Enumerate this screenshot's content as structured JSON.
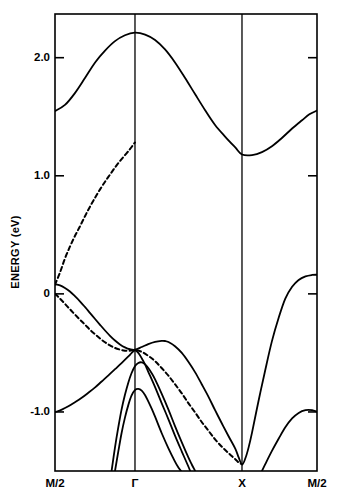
{
  "chart_data": {
    "type": "line",
    "title": "",
    "subtitle": "",
    "xlabel": "",
    "ylabel": "ENERGY (eV)",
    "ylim": [
      -1.5,
      2.37
    ],
    "xlim": [
      0,
      1
    ],
    "grid": false,
    "legend_position": "none",
    "yticks": [
      {
        "value": 2.0,
        "label": "2.0"
      },
      {
        "value": 1.0,
        "label": "1.0"
      },
      {
        "value": 0.0,
        "label": "0"
      },
      {
        "value": -1.0,
        "label": "-1.0"
      }
    ],
    "xticks": [
      {
        "value": 0.0,
        "label": "M/2"
      },
      {
        "value": 0.3053,
        "label": "Γ"
      },
      {
        "value": 0.7137,
        "label": "X"
      },
      {
        "value": 1.0,
        "label": "M/2"
      }
    ],
    "vertical_lines": [
      0.3053,
      0.7137
    ],
    "series": [
      {
        "name": "conduction-band-1",
        "style": "solid",
        "points": [
          [
            0.0,
            1.548
          ],
          [
            0.038,
            1.6
          ],
          [
            0.076,
            1.7
          ],
          [
            0.115,
            1.83
          ],
          [
            0.153,
            1.96
          ],
          [
            0.191,
            2.06
          ],
          [
            0.229,
            2.14
          ],
          [
            0.267,
            2.19
          ],
          [
            0.305,
            2.212
          ],
          [
            0.344,
            2.196
          ],
          [
            0.382,
            2.15
          ],
          [
            0.42,
            2.07
          ],
          [
            0.458,
            1.96
          ],
          [
            0.496,
            1.83
          ],
          [
            0.535,
            1.69
          ],
          [
            0.573,
            1.555
          ],
          [
            0.611,
            1.43
          ],
          [
            0.65,
            1.33
          ],
          [
            0.688,
            1.24
          ],
          [
            0.714,
            1.18
          ],
          [
            0.752,
            1.175
          ],
          [
            0.79,
            1.2
          ],
          [
            0.828,
            1.25
          ],
          [
            0.866,
            1.32
          ],
          [
            0.905,
            1.4
          ],
          [
            0.943,
            1.47
          ],
          [
            0.971,
            1.52
          ],
          [
            1.0,
            1.552
          ]
        ]
      },
      {
        "name": "dashed-band-upper",
        "style": "dashed",
        "points": [
          [
            0.0,
            0.078
          ],
          [
            0.019,
            0.18
          ],
          [
            0.038,
            0.3
          ],
          [
            0.057,
            0.4
          ],
          [
            0.076,
            0.49
          ],
          [
            0.096,
            0.575
          ],
          [
            0.115,
            0.66
          ],
          [
            0.134,
            0.74
          ],
          [
            0.153,
            0.815
          ],
          [
            0.172,
            0.885
          ],
          [
            0.191,
            0.95
          ],
          [
            0.21,
            1.01
          ],
          [
            0.229,
            1.07
          ],
          [
            0.248,
            1.125
          ],
          [
            0.267,
            1.175
          ],
          [
            0.286,
            1.225
          ],
          [
            0.296,
            1.255
          ],
          [
            0.305,
            1.282
          ]
        ]
      },
      {
        "name": "dashed-band-lower",
        "style": "dashed",
        "points": [
          [
            0.0,
            0.0
          ],
          [
            0.019,
            -0.04
          ],
          [
            0.038,
            -0.085
          ],
          [
            0.057,
            -0.13
          ],
          [
            0.076,
            -0.175
          ],
          [
            0.096,
            -0.22
          ],
          [
            0.115,
            -0.262
          ],
          [
            0.134,
            -0.305
          ],
          [
            0.153,
            -0.342
          ],
          [
            0.172,
            -0.378
          ],
          [
            0.191,
            -0.41
          ],
          [
            0.21,
            -0.437
          ],
          [
            0.229,
            -0.458
          ],
          [
            0.248,
            -0.472
          ],
          [
            0.267,
            -0.481
          ],
          [
            0.286,
            -0.481
          ],
          [
            0.305,
            -0.475
          ],
          [
            0.33,
            -0.49
          ],
          [
            0.356,
            -0.525
          ],
          [
            0.382,
            -0.57
          ],
          [
            0.407,
            -0.628
          ],
          [
            0.433,
            -0.693
          ],
          [
            0.458,
            -0.765
          ],
          [
            0.484,
            -0.843
          ],
          [
            0.509,
            -0.925
          ],
          [
            0.535,
            -1.005
          ],
          [
            0.56,
            -1.085
          ],
          [
            0.586,
            -1.16
          ],
          [
            0.611,
            -1.232
          ],
          [
            0.637,
            -1.295
          ],
          [
            0.663,
            -1.35
          ],
          [
            0.688,
            -1.4
          ],
          [
            0.701,
            -1.428
          ],
          [
            0.714,
            -1.442
          ]
        ]
      },
      {
        "name": "valence-band-1",
        "style": "solid",
        "points": [
          [
            0.0,
            0.082
          ],
          [
            0.019,
            0.072
          ],
          [
            0.038,
            0.05
          ],
          [
            0.057,
            0.02
          ],
          [
            0.076,
            -0.02
          ],
          [
            0.096,
            -0.065
          ],
          [
            0.115,
            -0.113
          ],
          [
            0.134,
            -0.163
          ],
          [
            0.153,
            -0.213
          ],
          [
            0.172,
            -0.262
          ],
          [
            0.191,
            -0.31
          ],
          [
            0.21,
            -0.355
          ],
          [
            0.229,
            -0.395
          ],
          [
            0.248,
            -0.428
          ],
          [
            0.267,
            -0.453
          ],
          [
            0.286,
            -0.469
          ],
          [
            0.305,
            -0.473
          ],
          [
            0.331,
            -0.45
          ],
          [
            0.356,
            -0.425
          ],
          [
            0.382,
            -0.406
          ],
          [
            0.407,
            -0.398
          ],
          [
            0.42,
            -0.399
          ],
          [
            0.433,
            -0.408
          ],
          [
            0.458,
            -0.443
          ],
          [
            0.484,
            -0.5
          ],
          [
            0.509,
            -0.575
          ],
          [
            0.535,
            -0.665
          ],
          [
            0.56,
            -0.765
          ],
          [
            0.586,
            -0.872
          ],
          [
            0.611,
            -0.985
          ],
          [
            0.637,
            -1.098
          ],
          [
            0.663,
            -1.208
          ],
          [
            0.688,
            -1.31
          ],
          [
            0.701,
            -1.385
          ],
          [
            0.714,
            -1.446
          ],
          [
            0.727,
            -1.39
          ],
          [
            0.739,
            -1.3
          ],
          [
            0.752,
            -1.175
          ],
          [
            0.777,
            -0.905
          ],
          [
            0.803,
            -0.64
          ],
          [
            0.828,
            -0.4
          ],
          [
            0.854,
            -0.2
          ],
          [
            0.879,
            -0.04
          ],
          [
            0.905,
            0.06
          ],
          [
            0.93,
            0.118
          ],
          [
            0.956,
            0.148
          ],
          [
            0.981,
            0.16
          ],
          [
            1.0,
            0.162
          ]
        ]
      },
      {
        "name": "valence-band-2",
        "style": "solid",
        "points": [
          [
            0.216,
            -1.5
          ],
          [
            0.229,
            -1.3
          ],
          [
            0.242,
            -1.125
          ],
          [
            0.254,
            -0.98
          ],
          [
            0.267,
            -0.855
          ],
          [
            0.28,
            -0.75
          ],
          [
            0.292,
            -0.672
          ],
          [
            0.305,
            -0.612
          ],
          [
            0.318,
            -0.585
          ],
          [
            0.331,
            -0.58
          ],
          [
            0.344,
            -0.597
          ],
          [
            0.356,
            -0.628
          ],
          [
            0.369,
            -0.672
          ],
          [
            0.382,
            -0.725
          ],
          [
            0.407,
            -0.845
          ],
          [
            0.433,
            -0.98
          ],
          [
            0.458,
            -1.12
          ],
          [
            0.484,
            -1.258
          ],
          [
            0.509,
            -1.385
          ],
          [
            0.522,
            -1.445
          ],
          [
            0.535,
            -1.5
          ]
        ]
      },
      {
        "name": "valence-band-3",
        "style": "solid",
        "points": [
          [
            0.229,
            -1.5
          ],
          [
            0.242,
            -1.33
          ],
          [
            0.254,
            -1.18
          ],
          [
            0.267,
            -1.048
          ],
          [
            0.28,
            -0.94
          ],
          [
            0.292,
            -0.862
          ],
          [
            0.305,
            -0.815
          ],
          [
            0.318,
            -0.805
          ],
          [
            0.331,
            -0.82
          ],
          [
            0.344,
            -0.858
          ],
          [
            0.356,
            -0.91
          ],
          [
            0.369,
            -0.972
          ],
          [
            0.382,
            -1.04
          ],
          [
            0.407,
            -1.178
          ],
          [
            0.433,
            -1.308
          ],
          [
            0.458,
            -1.42
          ],
          [
            0.471,
            -1.47
          ],
          [
            0.481,
            -1.5
          ]
        ]
      },
      {
        "name": "valence-band-4",
        "style": "solid",
        "points": [
          [
            0.0,
            -1.002
          ],
          [
            0.026,
            -0.98
          ],
          [
            0.051,
            -0.952
          ],
          [
            0.076,
            -0.918
          ],
          [
            0.102,
            -0.88
          ],
          [
            0.127,
            -0.838
          ],
          [
            0.153,
            -0.792
          ],
          [
            0.178,
            -0.742
          ],
          [
            0.204,
            -0.69
          ],
          [
            0.229,
            -0.638
          ],
          [
            0.254,
            -0.586
          ],
          [
            0.28,
            -0.53
          ],
          [
            0.292,
            -0.502
          ],
          [
            0.305,
            -0.478
          ],
          [
            0.318,
            -0.5
          ],
          [
            0.331,
            -0.545
          ],
          [
            0.344,
            -0.6
          ],
          [
            0.356,
            -0.66
          ],
          [
            0.382,
            -0.79
          ],
          [
            0.407,
            -0.925
          ],
          [
            0.433,
            -1.062
          ],
          [
            0.458,
            -1.2
          ],
          [
            0.484,
            -1.335
          ],
          [
            0.509,
            -1.462
          ],
          [
            0.516,
            -1.5
          ]
        ]
      },
      {
        "name": "valence-band-5-right",
        "style": "solid",
        "points": [
          [
            0.79,
            -1.5
          ],
          [
            0.803,
            -1.44
          ],
          [
            0.828,
            -1.33
          ],
          [
            0.854,
            -1.225
          ],
          [
            0.879,
            -1.13
          ],
          [
            0.905,
            -1.055
          ],
          [
            0.93,
            -1.008
          ],
          [
            0.956,
            -0.985
          ],
          [
            0.981,
            -0.985
          ],
          [
            1.0,
            -0.998
          ]
        ]
      }
    ]
  },
  "axes": {
    "y_axis_title": "ENERGY (eV)",
    "ytick_labels": [
      "2.0",
      "1.0",
      "0",
      "-1.0"
    ],
    "xtick_labels": [
      "M/2",
      "Γ",
      "X",
      "M/2"
    ]
  },
  "colors": {
    "line": "#000000",
    "frame": "#000000",
    "background": "#ffffff"
  }
}
